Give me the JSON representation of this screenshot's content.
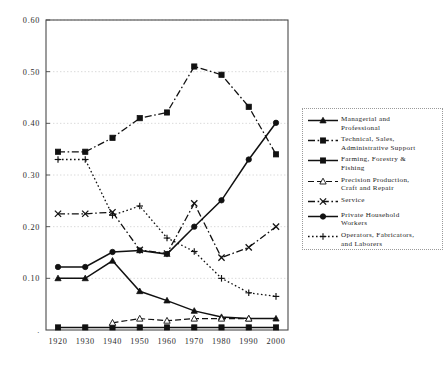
{
  "chart_data": {
    "type": "line",
    "title": "",
    "xlabel": "",
    "ylabel": "",
    "x": [
      1920,
      1930,
      1940,
      1950,
      1960,
      1970,
      1980,
      1990,
      2000
    ],
    "categories": [
      "1920",
      "1930",
      "1940",
      "1950",
      "1960",
      "1970",
      "1980",
      "1990",
      "2000"
    ],
    "xlim": [
      1915,
      2005
    ],
    "ylim": [
      0.0,
      0.6
    ],
    "ytick_labels": [
      "0.60",
      "0.50",
      "0.40",
      "0.30",
      "0.20",
      "0.10"
    ],
    "ytick_values": [
      0.6,
      0.5,
      0.4,
      0.3,
      0.2,
      0.1
    ],
    "grid": "horizontal-dotted",
    "legend_position": "right",
    "series": [
      {
        "name": "Managerial and\nProfessional",
        "marker": "triangle",
        "linestyle": "solid",
        "values": [
          0.1,
          0.1,
          0.134,
          0.075,
          0.057,
          0.037,
          0.025,
          0.022,
          0.022
        ]
      },
      {
        "name": "Technical, Sales,\nAdministrative Support",
        "marker": "square",
        "linestyle": "dashdot",
        "values": [
          0.345,
          0.345,
          0.372,
          0.41,
          0.421,
          0.51,
          0.494,
          0.432,
          0.34
        ]
      },
      {
        "name": "Farming, Forestry &\nFishing",
        "marker": "square",
        "linestyle": "solid",
        "values": [
          0.005,
          0.005,
          0.005,
          0.005,
          0.005,
          0.005,
          0.005,
          0.005,
          0.005
        ]
      },
      {
        "name": "Precision Production,\nCraft and Repair",
        "marker": "triangle-open",
        "linestyle": "dashed",
        "values": [
          null,
          null,
          0.014,
          0.022,
          0.018,
          0.022,
          0.022,
          0.022,
          null
        ]
      },
      {
        "name": "Service",
        "marker": "x",
        "linestyle": "dashdot",
        "values": [
          0.225,
          0.225,
          0.228,
          0.155,
          0.148,
          0.245,
          0.14,
          0.16,
          0.2
        ]
      },
      {
        "name": " Private Household\nWorkers",
        "marker": "circle",
        "linestyle": "solid",
        "values": [
          0.122,
          0.122,
          0.151,
          0.154,
          0.147,
          0.2,
          0.251,
          0.33,
          0.401
        ]
      },
      {
        "name": "Operators, Fabricators,\nand Laborers",
        "marker": "plus",
        "linestyle": "dotted",
        "values": [
          0.33,
          0.33,
          0.222,
          0.24,
          0.178,
          0.152,
          0.1,
          0.072,
          0.065
        ]
      }
    ]
  },
  "legend": {
    "entries": [
      {
        "label": "Managerial and\nProfessional"
      },
      {
        "label": "Technical, Sales,\nAdministrative Support"
      },
      {
        "label": "Farming, Forestry &\nFishing"
      },
      {
        "label": "Precision Production,\nCraft and Repair"
      },
      {
        "label": "Service"
      },
      {
        "label": " Private Household\nWorkers"
      },
      {
        "label": "Operators, Fabricators,\nand Laborers"
      }
    ]
  },
  "colors": {
    "ink": "#111111",
    "frame": "#4a4a4a",
    "grid": "#c9c9c9",
    "background": "#ffffff"
  }
}
